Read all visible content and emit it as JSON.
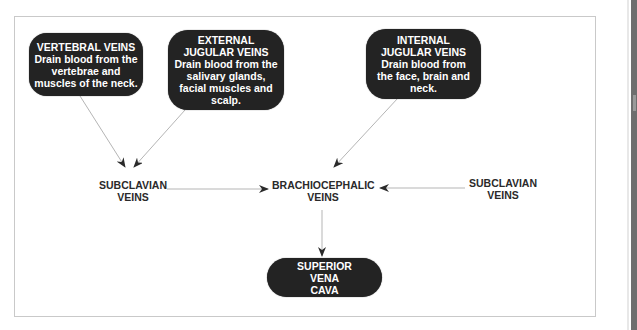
{
  "diagram": {
    "nodes": {
      "vertebral": {
        "title": "VERTEBRAL VEINS",
        "desc": "Drain blood from the vertebrae and muscles of the neck."
      },
      "external_jugular": {
        "title": "EXTERNAL JUGULAR VEINS",
        "desc": "Drain blood from the salivary glands, facial muscles and scalp."
      },
      "internal_jugular": {
        "title": "INTERNAL JUGULAR VEINS",
        "desc": "Drain blood from the face, brain and neck."
      },
      "subclavian_left": {
        "label": "SUBCLAVIAN VEINS"
      },
      "brachiocephalic": {
        "label": "BRACHIOCEPHALIC VEINS"
      },
      "subclavian_right": {
        "label": "SUBCLAVIAN VEINS"
      },
      "superior_vena_cava": {
        "label": "SUPERIOR VENA CAVA"
      }
    },
    "edges": [
      {
        "from": "VERTEBRAL VEINS",
        "to": "SUBCLAVIAN VEINS (left)"
      },
      {
        "from": "EXTERNAL JUGULAR VEINS",
        "to": "SUBCLAVIAN VEINS (left)"
      },
      {
        "from": "INTERNAL JUGULAR VEINS",
        "to": "BRACHIOCEPHALIC VEINS"
      },
      {
        "from": "SUBCLAVIAN VEINS (left)",
        "to": "BRACHIOCEPHALIC VEINS"
      },
      {
        "from": "SUBCLAVIAN VEINS (right)",
        "to": "BRACHIOCEPHALIC VEINS"
      },
      {
        "from": "BRACHIOCEPHALIC VEINS",
        "to": "SUPERIOR VENA CAVA"
      }
    ],
    "colors": {
      "node_fill": "#232323",
      "node_text": "#ffffff",
      "label_text": "#2a2a2a",
      "arrow": "#b5b5b5",
      "arrowhead": "#2a2a2a",
      "frame": "#c9c9c9"
    }
  }
}
